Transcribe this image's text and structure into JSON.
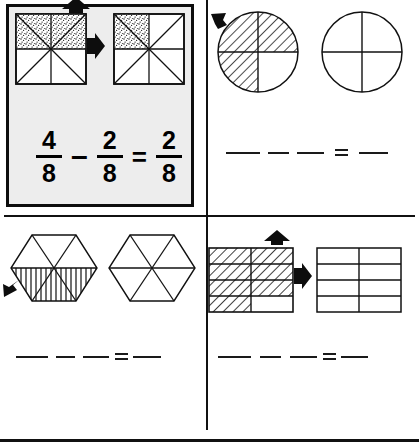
{
  "worksheet": {
    "title": "Fraction subtraction worksheet",
    "ink_color": "#111111",
    "example_panel_bg": "#ededed"
  },
  "panels": [
    {
      "id": "example",
      "name": "worked-example-panel",
      "is_example": true,
      "shape": "square",
      "total_parts": 8,
      "first_shaded": 4,
      "second_shaded": 2,
      "result_shaded": 2,
      "fill_style": "stipple",
      "arrows": [
        "arrow-up",
        "arrow-right"
      ],
      "equation": {
        "minuend": {
          "numerator": "4",
          "denominator": "8"
        },
        "minus_symbol": "–",
        "subtrahend": {
          "numerator": "2",
          "denominator": "8"
        },
        "equals_symbol": "=",
        "difference": {
          "numerator": "2",
          "denominator": "8"
        }
      }
    },
    {
      "id": "problem-1",
      "name": "problem-circles-panel",
      "is_example": false,
      "shape": "circle",
      "total_parts": 4,
      "first_shaded": 3,
      "second_shaded": 0,
      "fill_style": "diagonal-hatch",
      "arrows": [
        "arrow-up-left"
      ],
      "equation": {
        "blanks": 4,
        "equals_symbol": "=",
        "blanks_after_equals": 1
      }
    },
    {
      "id": "problem-2",
      "name": "problem-hexagons-panel",
      "is_example": false,
      "shape": "hexagon",
      "total_parts": 6,
      "first_shaded": 3,
      "second_shaded": 0,
      "fill_style": "vertical-hatch",
      "arrows": [
        "arrow-down-left"
      ],
      "equation": {
        "blanks": 4,
        "equals_symbol": "=",
        "blanks_after_equals": 1
      }
    },
    {
      "id": "problem-3",
      "name": "problem-rectangles-panel",
      "is_example": false,
      "shape": "rectangle-grid",
      "grid_columns": 2,
      "grid_rows": 4,
      "total_parts": 8,
      "first_shaded": 7,
      "second_shaded": 0,
      "fill_style": "diagonal-hatch",
      "arrows": [
        "arrow-up",
        "arrow-right"
      ],
      "equation": {
        "blanks": 4,
        "equals_symbol": "=",
        "blanks_after_equals": 1
      }
    }
  ]
}
